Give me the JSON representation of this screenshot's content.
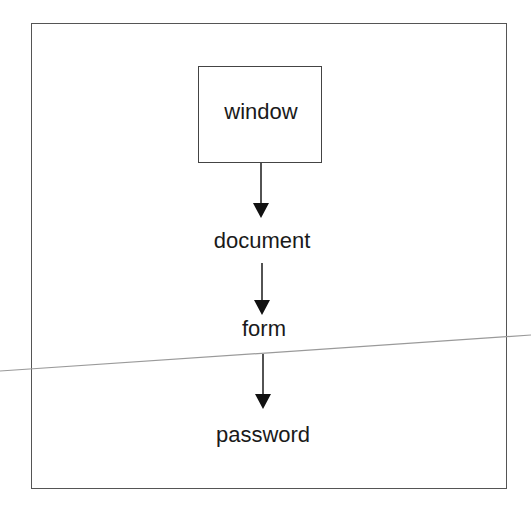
{
  "diagram": {
    "type": "hierarchy",
    "direction": "top-to-bottom",
    "nodes": [
      {
        "id": "window",
        "label": "window",
        "boxed": true,
        "cx": 260,
        "cy": 113
      },
      {
        "id": "document",
        "label": "document",
        "boxed": false,
        "cx": 262,
        "cy": 241
      },
      {
        "id": "form",
        "label": "form",
        "boxed": false,
        "cx": 264,
        "cy": 329
      },
      {
        "id": "password",
        "label": "password",
        "boxed": false,
        "cx": 263,
        "cy": 435
      }
    ],
    "edges": [
      {
        "from": "window",
        "to": "document"
      },
      {
        "from": "document",
        "to": "form"
      },
      {
        "from": "form",
        "to": "password"
      }
    ]
  },
  "colors": {
    "background": "#ffffff",
    "frame": "#555555",
    "stroke": "#1a1a1a",
    "text": "#1a1a1a",
    "scan_artifact_line": "#9a9a9a"
  }
}
